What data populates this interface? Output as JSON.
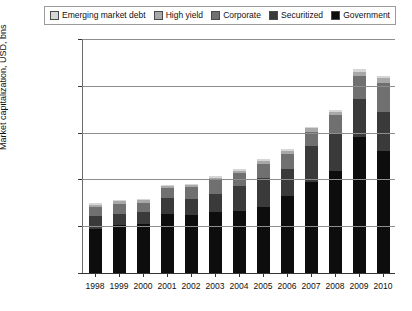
{
  "chart_data": {
    "type": "bar",
    "stacked": true,
    "title": "",
    "xlabel": "",
    "ylabel": "Market capitalization, USD, bns",
    "ylim": [
      0,
      50000
    ],
    "yticks": [
      0,
      10000,
      20000,
      30000,
      40000,
      50000
    ],
    "ytick_labels": [
      "0",
      "10,000",
      "20,000",
      "30,000",
      "40,000",
      "50,000"
    ],
    "grid": true,
    "legend_position": "top",
    "categories": [
      "1998",
      "1999",
      "2000",
      "2001",
      "2002",
      "2003",
      "2004",
      "2005",
      "2006",
      "2007",
      "2008",
      "2009",
      "2010"
    ],
    "series": [
      {
        "name": "Government",
        "color": "#0d0d0d",
        "values": [
          9400,
          10200,
          10400,
          12600,
          12500,
          13000,
          13300,
          14000,
          16500,
          19500,
          21800,
          29000,
          26000
        ]
      },
      {
        "name": "Securitized",
        "color": "#3a3a3a",
        "values": [
          2700,
          2500,
          2700,
          3500,
          3400,
          3900,
          5300,
          6400,
          5800,
          7700,
          8100,
          8100,
          8300
        ]
      },
      {
        "name": "Corporate",
        "color": "#707070",
        "values": [
          2000,
          2100,
          1900,
          2000,
          2400,
          2900,
          2700,
          3000,
          3100,
          3000,
          3800,
          5000,
          6300
        ]
      },
      {
        "name": "High yield",
        "color": "#a8a8a8",
        "values": [
          500,
          500,
          500,
          500,
          500,
          600,
          600,
          600,
          600,
          700,
          700,
          900,
          1100
        ]
      },
      {
        "name": "Emerging market debt",
        "color": "#d6d6d6",
        "values": [
          300,
          300,
          300,
          300,
          300,
          400,
          400,
          400,
          400,
          400,
          400,
          500,
          500
        ]
      }
    ],
    "totals": [
      14900,
      15600,
      15800,
      18900,
      19100,
      20800,
      22300,
      24400,
      26400,
      31300,
      34800,
      43500,
      42200
    ]
  },
  "legend": {
    "items": [
      {
        "label": "Emerging market debt",
        "color": "#d6d6d6"
      },
      {
        "label": "High yield",
        "color": "#a8a8a8"
      },
      {
        "label": "Corporate",
        "color": "#707070"
      },
      {
        "label": "Securitized",
        "color": "#3a3a3a"
      },
      {
        "label": "Government",
        "color": "#0d0d0d"
      }
    ]
  }
}
